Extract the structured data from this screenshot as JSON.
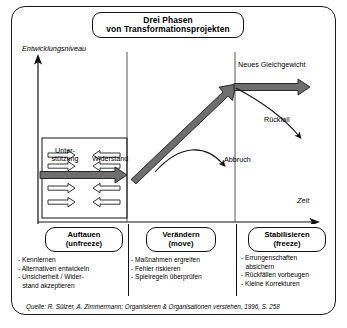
{
  "title": {
    "line1": "Drei Phasen",
    "line2": "von Transformationsprojekten"
  },
  "axes": {
    "y_label": "Entwicklungsniveau",
    "x_label": "Zeit"
  },
  "chart_labels": {
    "unterstuetzung_line1": "Unter-",
    "unterstuetzung_line2": "stützung",
    "widerstand": "Widerstand",
    "neues_gleichgewicht": "Neues Gleichgewicht",
    "rueckfall": "Rückfall",
    "abbruch": "Abbruch"
  },
  "phases": [
    {
      "name": "Auftauen",
      "english": "(unfreeze)",
      "bullets": [
        {
          "text": "- Kennlernen",
          "cont": false
        },
        {
          "text": "- Alternativen entwickeln",
          "cont": false
        },
        {
          "text": "- Unsicherheit / Wider-",
          "cont": false
        },
        {
          "text": "stand akzeptieren",
          "cont": true
        }
      ]
    },
    {
      "name": "Verändern",
      "english": "(move)",
      "bullets": [
        {
          "text": "- Maßnahmen ergreifen",
          "cont": false
        },
        {
          "text": "- Fehler riskieren",
          "cont": false
        },
        {
          "text": "- Spielregeln überprüfen",
          "cont": false
        }
      ]
    },
    {
      "name": "Stabilisieren",
      "english": "(freeze)",
      "bullets": [
        {
          "text": "- Errungenschaften",
          "cont": false
        },
        {
          "text": "absichern",
          "cont": true
        },
        {
          "text": "- Rückfällen vorbeugen",
          "cont": false
        },
        {
          "text": "- Kleine Korrekturen",
          "cont": false
        }
      ]
    }
  ],
  "source": "Quelle: R. Sülzer, A. Zimmermann: Organisieren & Organisationen verstehen, 1996, S. 258",
  "colors": {
    "ink": "#111111",
    "thick_arrow": "#6e6e6e",
    "thick_arrow_dark": "#4a4a4a",
    "background": "#ffffff"
  },
  "chart_data": {
    "type": "line",
    "title": "Drei Phasen von Transformationsprojekten",
    "xlabel": "Zeit",
    "ylabel": "Entwicklungsniveau",
    "grid": false,
    "legend": null,
    "phase_boundaries": [
      "Auftauen (unfreeze)",
      "Verändern (move)",
      "Stabilisieren (freeze)"
    ],
    "series": [
      {
        "name": "Hauptverlauf",
        "points": [
          [
            0.06,
            0.18
          ],
          [
            0.38,
            0.18
          ],
          [
            0.72,
            0.9
          ],
          [
            1.0,
            0.9
          ]
        ],
        "style": "thick-gray-arrow"
      },
      {
        "name": "Abbruch",
        "points": [
          [
            0.52,
            0.6
          ],
          [
            0.66,
            0.7
          ],
          [
            0.76,
            0.42
          ]
        ],
        "style": "thin-curved-arrow"
      },
      {
        "name": "Rückfall",
        "points": [
          [
            0.72,
            0.9
          ],
          [
            0.86,
            0.72
          ],
          [
            0.94,
            0.58
          ]
        ],
        "style": "thin-curved-arrow"
      }
    ],
    "force_arrows": {
      "unterstuetzung": {
        "label": "Unterstützung",
        "direction": "right",
        "count": 4
      },
      "widerstand": {
        "label": "Widerstand",
        "direction": "left",
        "count": 4
      }
    },
    "annotations": [
      "Neues Gleichgewicht",
      "Rückfall",
      "Abbruch",
      "Unterstützung",
      "Widerstand"
    ]
  }
}
